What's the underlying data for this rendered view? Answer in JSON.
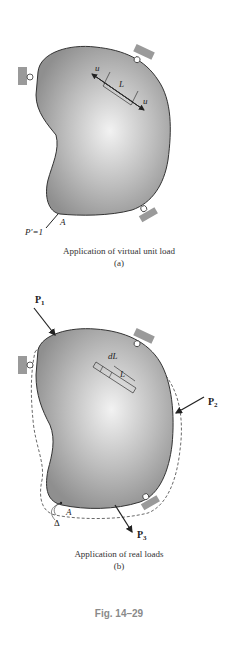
{
  "figure_a": {
    "caption": "Application of virtual unit load",
    "sublabel": "(a)",
    "labels": {
      "u_top": "u",
      "u_bottom": "u",
      "length": "L",
      "point": "A",
      "load": "P′=1"
    }
  },
  "figure_b": {
    "caption": "Application of real loads",
    "sublabel": "(b)",
    "labels": {
      "p1": "P",
      "p1_sub": "1",
      "p2": "P",
      "p2_sub": "2",
      "p3": "P",
      "p3_sub": "3",
      "dl": "dL",
      "length": "L",
      "point": "A",
      "delta": "Δ"
    }
  },
  "figure_number": "Fig. 14–29",
  "colors": {
    "body_fill": "#a9a9a9",
    "body_highlight": "#ececec",
    "support": "#9a9a9a",
    "line": "#222222",
    "fig_label": "#8a8a8a"
  }
}
